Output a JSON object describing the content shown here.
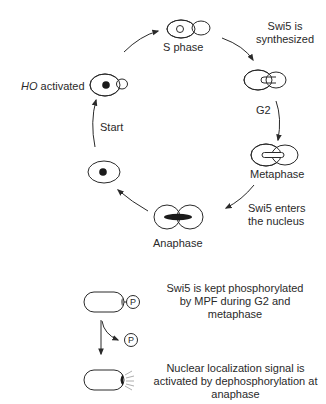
{
  "cycle": {
    "stages": {
      "s_phase": "S phase",
      "g2": "G2",
      "metaphase": "Metaphase",
      "anaphase": "Anaphase"
    },
    "events": {
      "swi5_synthesized_line1": "Swi5 is",
      "swi5_synthesized_line2": "synthesized",
      "swi5_enters_line1": "Swi5 enters",
      "swi5_enters_line2": "the nucleus",
      "start": "Start",
      "ho_italic": "HO",
      "ho_rest": " activated"
    }
  },
  "mechanism": {
    "phospho_symbol": "P",
    "top_text_line1": "Swi5 is kept phosphorylated",
    "top_text_line2": "by MPF during G2 and",
    "top_text_line3": "metaphase",
    "bottom_text_line1": "Nuclear localization signal is",
    "bottom_text_line2": "activated by dephosphorylation at",
    "bottom_text_line3": "anaphase"
  },
  "colors": {
    "stroke": "#2a2a2a",
    "background": "#ffffff"
  }
}
